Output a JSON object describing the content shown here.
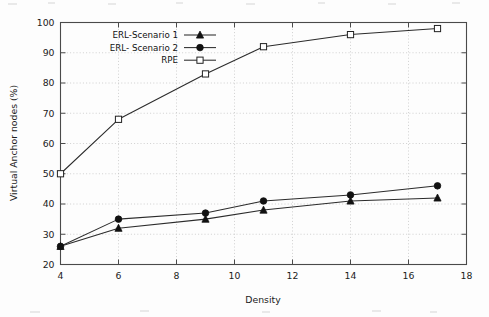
{
  "chart_data": {
    "type": "line",
    "title": "",
    "xlabel": "Density",
    "ylabel": "Virtual Anchor nodes (%)",
    "xlim": [
      4,
      18
    ],
    "ylim": [
      20,
      100
    ],
    "xticks": [
      4,
      6,
      8,
      10,
      12,
      14,
      16,
      18
    ],
    "yticks": [
      20,
      30,
      40,
      50,
      60,
      70,
      80,
      90,
      100
    ],
    "grid": true,
    "legend_position": "upper left (inside axes)",
    "x": [
      4,
      6,
      9,
      11,
      14,
      17
    ],
    "series": [
      {
        "name": "ERL-Scenario 1",
        "marker": "filled-triangle",
        "values": [
          26,
          32,
          35,
          38,
          41,
          42
        ]
      },
      {
        "name": "ERL- Scenario 2",
        "marker": "filled-circle",
        "values": [
          26,
          35,
          37,
          41,
          43,
          46
        ]
      },
      {
        "name": "RPE",
        "marker": "open-square",
        "values": [
          50,
          68,
          83,
          92,
          96,
          98
        ]
      }
    ]
  },
  "axes": {
    "x_title": "Density",
    "y_title": "Virtual Anchor nodes (%)",
    "x_tick_labels": [
      "4",
      "6",
      "8",
      "10",
      "12",
      "14",
      "16",
      "18"
    ],
    "y_tick_labels": [
      "20",
      "30",
      "40",
      "50",
      "60",
      "70",
      "80",
      "90",
      "100"
    ]
  },
  "legend": {
    "items": [
      {
        "label": "ERL-Scenario 1",
        "marker": "filled-triangle"
      },
      {
        "label": "ERL- Scenario 2",
        "marker": "filled-circle"
      },
      {
        "label": "RPE",
        "marker": "open-square"
      }
    ]
  },
  "colors": {
    "line": "#2b2b2b",
    "axis": "#4a4a4a",
    "grid": "#bdbdbd",
    "text": "#1b1b1b",
    "background": "#fdfdfd"
  }
}
